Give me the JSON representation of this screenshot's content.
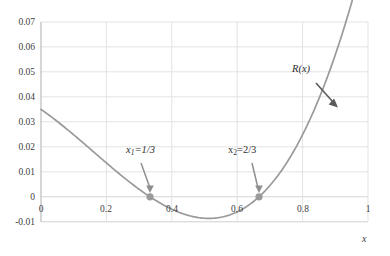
{
  "chart_data": {
    "type": "line",
    "title": "",
    "subtitle": "",
    "xlabel": "x",
    "ylabel": "",
    "xlim": [
      0,
      1
    ],
    "ylim": [
      -0.01,
      0.07
    ],
    "grid": true,
    "legend_position": "none",
    "x_ticks": [
      "0",
      "0.2",
      "0.4",
      "0.6",
      "0.8",
      "1"
    ],
    "x_tick_values": [
      0,
      0.2,
      0.4,
      0.6,
      0.8,
      1
    ],
    "y_ticks": [
      "-0.01",
      "0",
      "0.01",
      "0.02",
      "0.03",
      "0.04",
      "0.05",
      "0.06",
      "0.07"
    ],
    "y_tick_values": [
      -0.01,
      0,
      0.01,
      0.02,
      0.03,
      0.04,
      0.05,
      0.06,
      0.07
    ],
    "series": [
      {
        "name": "R(x)",
        "color": "#9a9a9a",
        "x": [
          0.0,
          0.05,
          0.1,
          0.15,
          0.2,
          0.25,
          0.3,
          0.3333,
          0.35,
          0.4,
          0.45,
          0.5,
          0.55,
          0.6,
          0.65,
          0.6667,
          0.7,
          0.75,
          0.8,
          0.85,
          0.9,
          0.95,
          1.0
        ],
        "y": [
          0.035,
          0.03,
          0.0252,
          0.0208,
          0.0166,
          0.0127,
          0.009,
          0.0,
          0.0035,
          0.0007,
          -0.001,
          -0.0016,
          -0.0013,
          -0.0005,
          0.0004,
          0.0,
          0.003,
          0.0073,
          0.0138,
          0.0226,
          0.034,
          0.0484,
          0.066
        ]
      }
    ],
    "markers": [
      {
        "label": "x1",
        "x": 0.3333,
        "y": 0.0,
        "color": "#9a9a9a"
      },
      {
        "label": "x2",
        "x": 0.6667,
        "y": 0.0,
        "color": "#9a9a9a"
      }
    ],
    "annotations": [
      {
        "name": "x1-root-label",
        "text_prefix": "x",
        "text_sub": "1",
        "text_suffix": "=1/3",
        "points_to_x": 0.3333,
        "points_to_y": 0.0
      },
      {
        "name": "x2-root-label",
        "text_prefix": "x",
        "text_sub": "2",
        "text_suffix": "=2/3",
        "points_to_x": 0.6667,
        "points_to_y": 0.0
      },
      {
        "name": "curve-label",
        "text_prefix": "R(x)",
        "text_sub": "",
        "text_suffix": "",
        "points_to_x": 0.875,
        "points_to_y": 0.0405
      }
    ]
  },
  "axes": {
    "x_label": "x",
    "x_tick_0": "0",
    "x_tick_1": "0.2",
    "x_tick_2": "0.4",
    "x_tick_3": "0.6",
    "x_tick_4": "0.8",
    "x_tick_5": "1",
    "y_tick_0": "0.07",
    "y_tick_1": "0.06",
    "y_tick_2": "0.05",
    "y_tick_3": "0.04",
    "y_tick_4": "0.03",
    "y_tick_5": "0.02",
    "y_tick_6": "0.01",
    "y_tick_7": "0",
    "y_tick_8": "-0.01"
  },
  "labels": {
    "x1_main": "x",
    "x1_sub": "1",
    "x1_rest": "=1/3",
    "x2_main": "x",
    "x2_sub": "2",
    "x2_rest": "=2/3",
    "curve": "R(x)"
  },
  "colors": {
    "curve": "#9a9a9a",
    "grid": "#e3e3e3",
    "axis": "#b5b5b5",
    "marker": "#8f8f8f",
    "arrow": "#8f8f8f",
    "text": "#404040"
  }
}
